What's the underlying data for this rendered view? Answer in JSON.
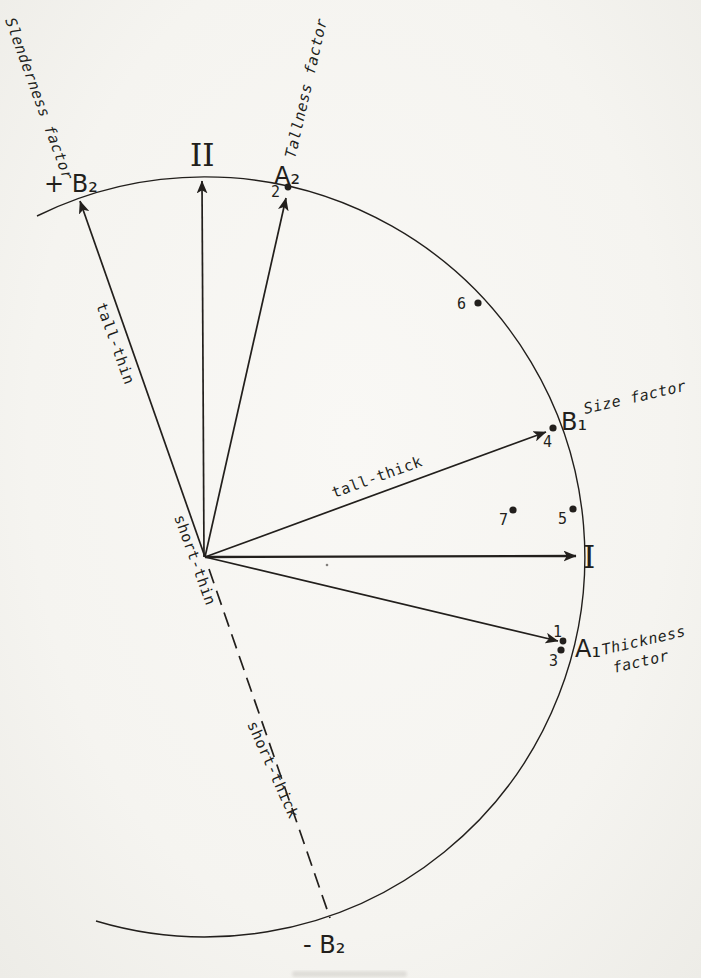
{
  "colors": {
    "background": "#f6f5f1",
    "ink": "#221f1c"
  },
  "diagram": {
    "axis_labels": {
      "one": "I",
      "two": "II"
    },
    "vector_labels": {
      "a1": "A₁",
      "a2": "A₂",
      "b1": "B₁",
      "plus_b2": "+ B₂",
      "minus_b2": "- B₂"
    },
    "factor_labels": {
      "slenderness": "Slenderness factor",
      "tallness": "Tallness factor",
      "size": "Size factor",
      "thickness_line1": "Thickness",
      "thickness_line2": "factor"
    },
    "type_labels": {
      "tall_thin": "tall-thin",
      "short_thin": "short-thin",
      "tall_thick": "tall-thick",
      "short_thick": "short-thick"
    },
    "points": {
      "p1": {
        "label": "1"
      },
      "p2": {
        "label": "2"
      },
      "p3": {
        "label": "3"
      },
      "p4": {
        "label": "4"
      },
      "p5": {
        "label": "5"
      },
      "p6": {
        "label": "6"
      },
      "p7": {
        "label": "7"
      }
    }
  }
}
